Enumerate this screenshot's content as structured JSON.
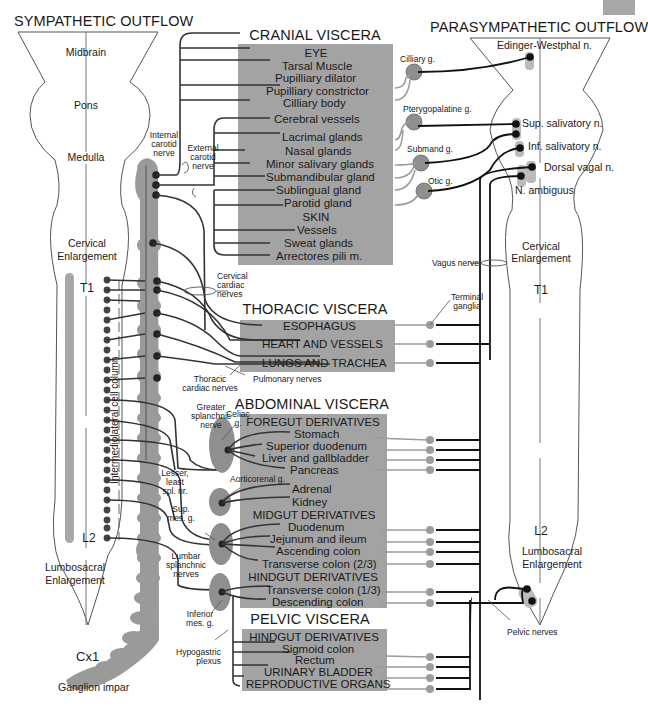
{
  "titles": {
    "sympathetic": "SYMPATHETIC OUTFLOW",
    "parasympathetic": "PARASYMPATHETIC OUTFLOW"
  },
  "sympathetic_cord": {
    "regions": [
      "Midbrain",
      "Pons",
      "Medulla",
      "Cervical",
      "Enlargement",
      "T1",
      "L2",
      "Lumbosacral",
      "Enlargement"
    ],
    "cell_column": "Intermediolateral cell column",
    "coccygeal": "Cx1",
    "ganglion_impar": "Ganglion impar"
  },
  "parasympathetic_cord": {
    "nuclei": [
      "Edinger-Westphal n.",
      "Sup. salivatory n.",
      "Inf. salivatory n.",
      "Dorsal vagal n.",
      "N. ambiguus"
    ],
    "regions": [
      "Cervical",
      "Enlargement",
      "T1",
      "L2",
      "Lumbosacral",
      "Enlargement"
    ]
  },
  "cranial": {
    "title": "CRANIAL VISCERA",
    "eye_header": "EYE",
    "eye": [
      "Tarsal Muscle",
      "Pupilliary dilator",
      "Pupilliary constrictor",
      "Cilliary body"
    ],
    "other": [
      "Cerebral vessels",
      "Lacrimal glands",
      "Nasal glands",
      "Minor salivary glands",
      "Submandibular gland",
      "Sublingual gland",
      "Parotid gland"
    ],
    "skin_header": "SKIN",
    "skin": [
      "Vessels",
      "Sweat glands",
      "Arrectores pili m."
    ]
  },
  "thoracic": {
    "title": "THORACIC VISCERA",
    "items": [
      "ESOPHAGUS",
      "HEART AND VESSELS",
      "LUNGS AND TRACHEA"
    ]
  },
  "abdominal": {
    "title": "ABDOMINAL VISCERA",
    "foregut_header": "FOREGUT DERIVATIVES",
    "foregut": [
      "Stomach",
      "Superior duodenum",
      "Liver and gallbladder",
      "Pancreas"
    ],
    "other": [
      "Adrenal",
      "Kidney"
    ],
    "midgut_header": "MIDGUT DERIVATIVES",
    "midgut": [
      "Duodenum",
      "Jejunum and ileum",
      "Ascending colon",
      "Transverse colon (2/3)"
    ],
    "hindgut_header": "HINDGUT DERIVATIVES",
    "hindgut": [
      "Transverse colon (1/3)",
      "Descending colon"
    ]
  },
  "pelvic": {
    "title": "PELVIC VISCERA",
    "hindgut_header": "HINDGUT DERIVATIVES",
    "items": [
      "Sigmoid colon",
      "Rectum",
      "URINARY BLADDER",
      "REPRODUCTIVE ORGANS"
    ]
  },
  "nerve_labels": {
    "internal_carotid": [
      "Internal",
      "carotid",
      "nerve"
    ],
    "external_carotid": [
      "External",
      "carotid",
      "nerve"
    ],
    "cervical_cardiac": [
      "Cervical",
      "cardiac",
      "nerves"
    ],
    "thoracic_cardiac": [
      "Thoracic",
      "cardiac nerves"
    ],
    "pulmonary": "Pulmonary nerves",
    "greater_splanchnic": [
      "Greater",
      "splanchnic",
      "nerve"
    ],
    "celiac": [
      "Celiac",
      "g."
    ],
    "lesser_splanchnic": [
      "Lesser,",
      "least",
      "spl. nr."
    ],
    "aorticorenal": "Aorticorenal g.",
    "sup_mes": [
      "Sup.",
      "mes. g."
    ],
    "lumbar_splanchnic": [
      "Lumbar",
      "splanchnic",
      "nerves"
    ],
    "inferior_mes": [
      "Inferior",
      "mes. g."
    ],
    "hypogastric": [
      "Hypogastric",
      "plexus"
    ],
    "vagus": "Vagus nerve",
    "terminal_ganglia": [
      "Terminal",
      "ganglia"
    ],
    "pelvic": "Pelvic nerves"
  },
  "para_ganglia": [
    "Cilliary g.",
    "Pterygopalatine g.",
    "Submand g.",
    "Otic g."
  ],
  "colors": {
    "box_gray": "#a3a3a3",
    "chain_gray": "#9a9a9a",
    "ganglion_gray": "#8f8f8f",
    "neuron": "#2a2a2a",
    "postganglionic_para": "#9c9c9c"
  }
}
